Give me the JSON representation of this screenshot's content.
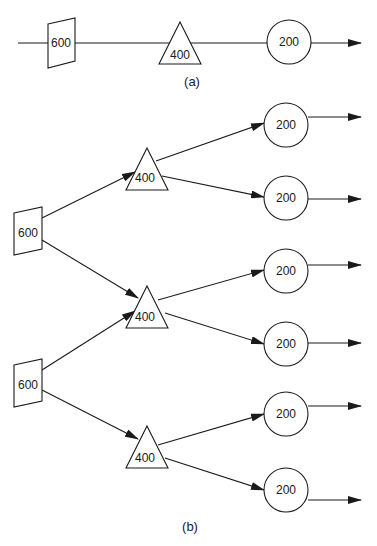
{
  "figure": {
    "part_a": {
      "caption": "(a)",
      "nodes": [
        {
          "shape": "trapezoid",
          "label": "600"
        },
        {
          "shape": "triangle",
          "label": "400"
        },
        {
          "shape": "circle",
          "label": "200"
        }
      ]
    },
    "part_b": {
      "caption": "(b)",
      "trapezoids": [
        {
          "label": "600"
        },
        {
          "label": "600"
        }
      ],
      "triangles": [
        {
          "label": "400"
        },
        {
          "label": "400"
        },
        {
          "label": "400"
        }
      ],
      "circles": [
        {
          "label": "200"
        },
        {
          "label": "200"
        },
        {
          "label": "200"
        },
        {
          "label": "200"
        },
        {
          "label": "200"
        },
        {
          "label": "200"
        }
      ]
    }
  }
}
